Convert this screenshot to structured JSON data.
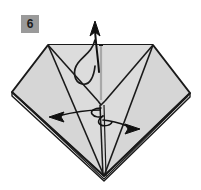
{
  "figure": {
    "kind": "origami-fold-diagram",
    "step_number": "6",
    "background_color": "#ffffff",
    "paper_fill_color": "#d6d6d6",
    "paper_fill_color_light": "#e4e4e4",
    "outline_color": "#1a1a1a",
    "crease_color": "#2b2b2b",
    "arrow_color": "#111111",
    "badge": {
      "label": "6",
      "background_color": "#9a9a9a",
      "text_color": "#1a1a1a"
    },
    "shape": {
      "name": "diamond-outline",
      "vertices": [
        {
          "name": "top-left-corner",
          "x": 48,
          "y": 45
        },
        {
          "name": "top-right-corner",
          "x": 153,
          "y": 45
        },
        {
          "name": "right-vertex",
          "x": 190,
          "y": 93
        },
        {
          "name": "bottom-point",
          "x": 104,
          "y": 176
        },
        {
          "name": "left-vertex",
          "x": 12,
          "y": 92
        }
      ]
    },
    "creases": [
      {
        "name": "left-fan-outer",
        "from": "top-left-corner",
        "to": "bottom-point"
      },
      {
        "name": "left-fan-inner",
        "from": "top-left-corner",
        "to": "center-notch"
      },
      {
        "name": "right-fan-outer",
        "from": "top-right-corner",
        "to": "bottom-point"
      },
      {
        "name": "right-fan-inner",
        "from": "top-right-corner",
        "to": "center-notch"
      },
      {
        "name": "center-vertical",
        "from": "top-edge-center",
        "to": "bottom-point"
      },
      {
        "name": "left-diagonal-spread",
        "from": "left-vertex",
        "to": "bottom-point"
      },
      {
        "name": "right-diagonal-spread",
        "from": "right-vertex",
        "to": "bottom-point"
      }
    ],
    "arrows": [
      {
        "name": "lift-up-arrow",
        "direction": "up",
        "meaning": "lift flap upward",
        "tip": {
          "x": 95,
          "y": 22
        },
        "tail": {
          "x": 99,
          "y": 72
        }
      },
      {
        "name": "spread-left-arrow",
        "direction": "left",
        "meaning": "spread layer to the left",
        "tip": {
          "x": 50,
          "y": 117
        },
        "tail": {
          "x": 100,
          "y": 110
        }
      },
      {
        "name": "spread-right-arrow",
        "direction": "right",
        "meaning": "spread layer to the right",
        "tip": {
          "x": 139,
          "y": 129
        },
        "tail": {
          "x": 100,
          "y": 118
        }
      },
      {
        "name": "tuck-curve",
        "direction": "curved",
        "meaning": "curved tuck / wrap line from top flap down and back up",
        "tip": {
          "x": 95,
          "y": 38
        },
        "tail": {
          "x": 73,
          "y": 62
        }
      }
    ]
  }
}
